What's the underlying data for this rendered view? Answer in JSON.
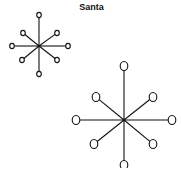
{
  "title": "Santa",
  "colors": {
    "stroke": "#111111",
    "background": "#ffffff"
  },
  "stars": [
    {
      "name": "small-star",
      "center": [
        39,
        46
      ],
      "node_radius": [
        2.3,
        2.6
      ],
      "nodes": [
        [
          39,
          15
        ],
        [
          57,
          33
        ],
        [
          68,
          46
        ],
        [
          57,
          60
        ],
        [
          39,
          74
        ],
        [
          22,
          60
        ],
        [
          12,
          46
        ],
        [
          23,
          33
        ]
      ]
    },
    {
      "name": "large-star",
      "center": [
        124,
        120
      ],
      "node_radius": [
        3.8,
        4.5
      ],
      "nodes": [
        [
          124,
          66
        ],
        [
          153,
          97
        ],
        [
          172,
          120
        ],
        [
          153,
          144
        ],
        [
          124,
          165
        ],
        [
          94,
          144
        ],
        [
          76,
          120
        ],
        [
          96,
          97
        ]
      ]
    }
  ]
}
